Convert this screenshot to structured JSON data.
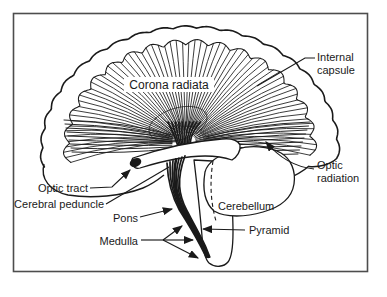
{
  "figure": {
    "type": "line-drawing",
    "labels": {
      "corona_radiata": "Corona radiata",
      "internal_capsule": [
        "Internal",
        "capsule"
      ],
      "optic_tract": "Optic tract",
      "cerebral_peduncle": "Cerebral peduncle",
      "pons": "Pons",
      "medulla": "Medulla",
      "cerebellum": "Cerebellum",
      "pyramid": "Pyramid",
      "optic_radiation": [
        "Optic",
        "radiation"
      ]
    },
    "colors": {
      "ink": "#1a1a1a",
      "paper": "#ffffff",
      "frame": "#4d4d4d"
    }
  }
}
